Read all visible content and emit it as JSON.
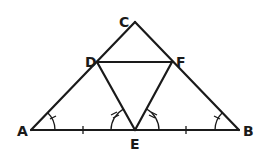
{
  "diagram": {
    "stroke_color": "#1a1a1a",
    "background": "#ffffff",
    "points": {
      "A": {
        "label": "A",
        "x": 31,
        "y": 130
      },
      "B": {
        "label": "B",
        "x": 239,
        "y": 130
      },
      "C": {
        "label": "C",
        "x": 135,
        "y": 22
      },
      "D": {
        "label": "D",
        "x": 97,
        "y": 62
      },
      "E": {
        "label": "E",
        "x": 135,
        "y": 130
      },
      "F": {
        "label": "F",
        "x": 172,
        "y": 62
      }
    },
    "segments": [
      "AB",
      "AC",
      "BC",
      "DF",
      "DE",
      "EF"
    ],
    "tick_marks": [
      {
        "segment": "AE",
        "count": 1
      },
      {
        "segment": "EB",
        "count": 1
      }
    ],
    "angle_marks": [
      {
        "vertex": "A",
        "between": "AB-AC",
        "hatches": 1
      },
      {
        "vertex": "B",
        "between": "BA-BC",
        "hatches": 1
      },
      {
        "vertex": "E",
        "between": "EA-ED",
        "hatches": 2
      },
      {
        "vertex": "E",
        "between": "EB-EF",
        "hatches": 2
      }
    ],
    "labels": {
      "A": "A",
      "B": "B",
      "C": "C",
      "D": "D",
      "E": "E",
      "F": "F"
    }
  }
}
